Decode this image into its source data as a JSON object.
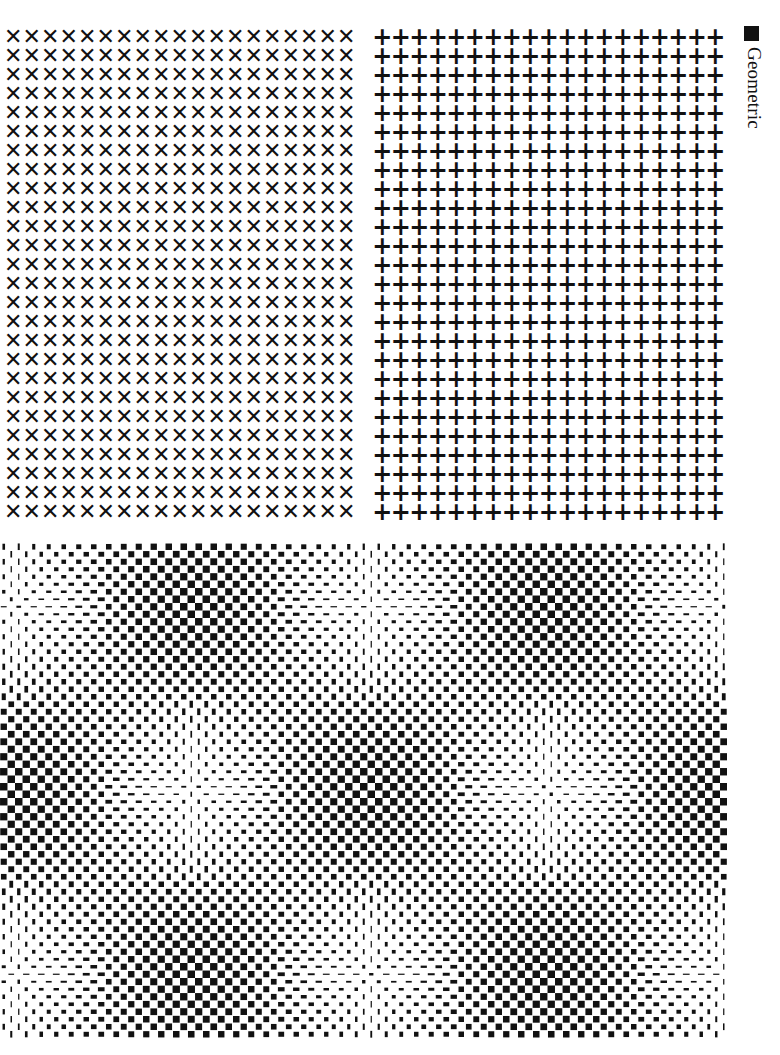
{
  "side_label": {
    "bullet": "■",
    "text": "Geometric"
  },
  "x_grid": {
    "glyph": "✕",
    "columns": 19,
    "rows": 26
  },
  "plus_grid": {
    "glyph": "+",
    "columns": 19,
    "rows": 26
  },
  "op_art": {
    "width": 727,
    "height": 495,
    "cell": 7.5,
    "period_x": 355,
    "period_y": 370,
    "origin_x": 15,
    "origin_y": 62,
    "ink": "#111111",
    "paper": "#ffffff"
  }
}
